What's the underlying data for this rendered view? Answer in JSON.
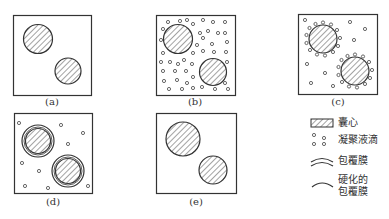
{
  "figure": {
    "panels": [
      {
        "id": "a",
        "label": "(a)",
        "description": "two capsule cores dispersed"
      },
      {
        "id": "b",
        "label": "(b)",
        "description": "cores with many coacervate droplets"
      },
      {
        "id": "c",
        "label": "(c)",
        "description": "droplets adsorb around cores"
      },
      {
        "id": "d",
        "label": "(d)",
        "description": "coating membrane formed"
      },
      {
        "id": "e",
        "label": "(e)",
        "description": "hardened coating membrane"
      }
    ],
    "legend": {
      "core": "囊心",
      "droplets": "凝聚液滴",
      "membrane": "包覆膜",
      "hardened_line1": "硬化的",
      "hardened_line2": "包覆膜"
    },
    "colors": {
      "stroke": "#333333",
      "hatch": "#555555",
      "background": "#ffffff"
    }
  }
}
